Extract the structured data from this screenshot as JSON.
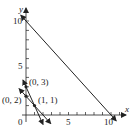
{
  "figure": {
    "axes": {
      "x_label": "x",
      "y_label": "y",
      "origin_label": "0",
      "x_ticks": [
        1,
        2,
        3,
        4,
        5,
        6,
        7,
        8,
        9,
        10,
        11
      ],
      "y_ticks": [
        1,
        2,
        3,
        4,
        5,
        6,
        7,
        8,
        9,
        10
      ],
      "x_tick_labels": {
        "5": "5",
        "10": "10"
      },
      "y_tick_labels": {
        "5": "5",
        "10": "10"
      }
    },
    "lines": [
      {
        "name": "x + y = 10",
        "from": [
          -0.6,
          10.6
        ],
        "to": [
          10.6,
          -0.6
        ]
      },
      {
        "name": "2x + y = 3",
        "from": [
          -0.35,
          3.7
        ],
        "to": [
          2.0,
          -1.0
        ]
      },
      {
        "name": "x + y = 2",
        "from": [
          -0.8,
          2.8
        ],
        "to": [
          2.9,
          -0.9
        ]
      }
    ],
    "points": [
      {
        "label": "(0, 3)",
        "x": 0,
        "y": 3
      },
      {
        "label": "(0, 2)",
        "x": 0,
        "y": 2
      },
      {
        "label": "(1, 1)",
        "x": 1,
        "y": 1
      }
    ],
    "colors": {
      "ink": "#222222",
      "background": "#ffffff"
    }
  }
}
